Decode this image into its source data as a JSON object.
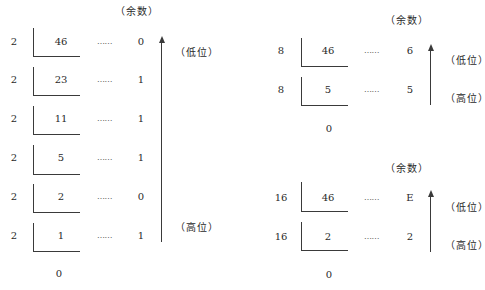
{
  "labels": {
    "remainder": "（余数）",
    "low_bit": "（低位）",
    "high_bit": "（高位）",
    "dots": "……"
  },
  "binary": {
    "divisor": "2",
    "rows": [
      {
        "dividend": "46",
        "remainder": "0"
      },
      {
        "dividend": "23",
        "remainder": "1"
      },
      {
        "dividend": "11",
        "remainder": "1"
      },
      {
        "dividend": "5",
        "remainder": "1"
      },
      {
        "dividend": "2",
        "remainder": "0"
      },
      {
        "dividend": "1",
        "remainder": "1"
      }
    ],
    "final_quotient": "0"
  },
  "octal": {
    "divisor": "8",
    "rows": [
      {
        "dividend": "46",
        "remainder": "6"
      },
      {
        "dividend": "5",
        "remainder": "5"
      }
    ],
    "final_quotient": "0"
  },
  "hex": {
    "divisor": "16",
    "rows": [
      {
        "dividend": "46",
        "remainder": "E"
      },
      {
        "dividend": "2",
        "remainder": "2"
      }
    ],
    "final_quotient": "0"
  }
}
